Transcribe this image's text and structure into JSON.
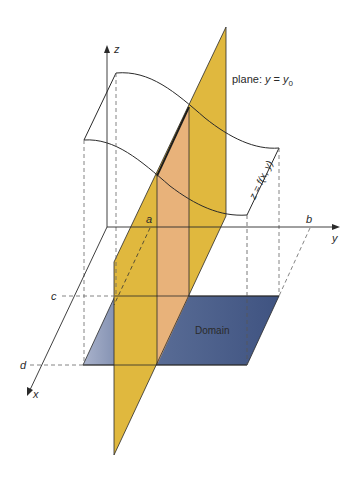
{
  "labels": {
    "z_axis": "z",
    "y_axis": "y",
    "x_axis": "x",
    "a": "a",
    "b": "b",
    "c": "c",
    "d": "d",
    "plane": "plane: ",
    "plane_eq_y": "y",
    "plane_eq_eq": " = ",
    "plane_eq_y0": "y",
    "plane_eq_sub": "0",
    "surface": "z = f(x, y)",
    "domain": "Domain"
  },
  "colors": {
    "plane": "#e0b83e",
    "slice": "#e8b27a",
    "domain_dark": "#4a5f8a",
    "domain_light": "#9aa6c2",
    "line": "#2a2a2a",
    "dash": "#555555"
  }
}
